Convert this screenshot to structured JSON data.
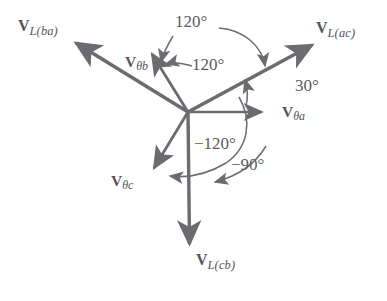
{
  "figure": {
    "type": "phasor-diagram",
    "title": "",
    "background_color": "#ffffff",
    "stroke_color": "#6b6b70",
    "text_color": "#55555a",
    "origin": {
      "x": 188,
      "y": 112
    }
  },
  "line_vectors": [
    {
      "id": "vl-ac",
      "label_v": "V",
      "label_sub": "L(ac)",
      "angle_deg": 30,
      "tip": {
        "x": 316,
        "y": 42
      },
      "label_pos": {
        "x": 318,
        "y": 20
      }
    },
    {
      "id": "vl-ba",
      "label_v": "V",
      "label_sub": "L(ba)",
      "angle_deg": 150,
      "tip": {
        "x": 72,
        "y": 40
      },
      "label_pos": {
        "x": 18,
        "y": 18
      }
    },
    {
      "id": "vl-cb",
      "label_v": "V",
      "label_sub": "L(cb)",
      "angle_deg": -90,
      "tip": {
        "x": 190,
        "y": 250
      },
      "label_pos": {
        "x": 196,
        "y": 252
      }
    }
  ],
  "phase_vectors": [
    {
      "id": "v-theta-a",
      "label_v": "V",
      "label_sub": "θa",
      "angle_deg": 0,
      "tip": {
        "x": 268,
        "y": 112
      },
      "label_pos": {
        "x": 283,
        "y": 105
      }
    },
    {
      "id": "v-theta-b",
      "label_v": "V",
      "label_sub": "θb",
      "angle_deg": 120,
      "tip": {
        "x": 148,
        "y": 49
      },
      "label_pos": {
        "x": 126,
        "y": 55
      }
    },
    {
      "id": "v-theta-c",
      "label_v": "V",
      "label_sub": "θc",
      "angle_deg": -120,
      "tip": {
        "x": 150,
        "y": 173
      },
      "label_pos": {
        "x": 112,
        "y": 174
      }
    }
  ],
  "angle_annotations": [
    {
      "id": "angle-120-upper",
      "text": "120°",
      "value": 120,
      "label_pos": {
        "x": 176,
        "y": 13
      },
      "points_to": "v-theta-b-to-vl-ac"
    },
    {
      "id": "angle-120-inner",
      "text": "120°",
      "value": 120,
      "label_pos": {
        "x": 193,
        "y": 57
      },
      "points_to": "v-theta-b"
    },
    {
      "id": "angle-30",
      "text": "30°",
      "value": 30,
      "label_pos": {
        "x": 296,
        "y": 78
      },
      "points_to": "vl-ac-from-v-theta-a"
    },
    {
      "id": "angle-minus-120",
      "text": "−120°",
      "value": -120,
      "label_pos": {
        "x": 196,
        "y": 136
      },
      "points_to": "v-theta-c"
    },
    {
      "id": "angle-minus-90",
      "text": "−90°",
      "value": -90,
      "label_pos": {
        "x": 232,
        "y": 157
      },
      "points_to": "vl-cb"
    }
  ]
}
